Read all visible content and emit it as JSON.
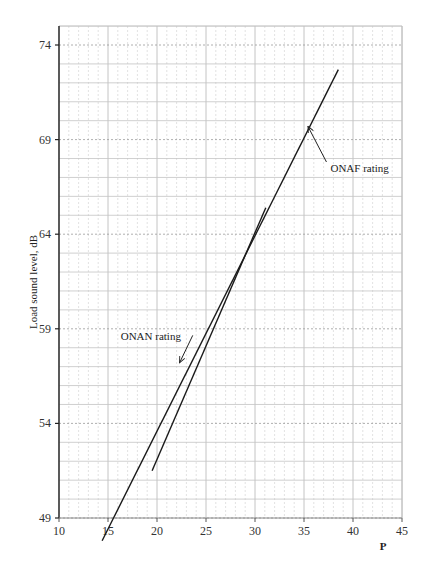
{
  "chart_data": {
    "type": "line",
    "title": "",
    "xlabel": "P",
    "ylabel": "Load sound level, dB",
    "xlim": [
      10,
      45
    ],
    "ylim": [
      49,
      74
    ],
    "x_ticks": [
      10,
      15,
      20,
      25,
      30,
      35,
      40,
      45
    ],
    "y_ticks": [
      49,
      54,
      59,
      64,
      69,
      74
    ],
    "grid": true,
    "legend": null,
    "series": [
      {
        "name": "ONAF rating",
        "x": [
          14.4,
          38.5
        ],
        "y": [
          47.8,
          72.7
        ]
      },
      {
        "name": "ONAN rating",
        "x": [
          19.5,
          31.1
        ],
        "y": [
          51.5,
          65.4
        ]
      }
    ],
    "annotations": [
      {
        "text": "ONAF rating",
        "x": 37.7,
        "y": 67.5,
        "arrow_to": [
          35.4,
          69.7
        ]
      },
      {
        "text": "ONAN rating",
        "x": 16.3,
        "y": 58.6,
        "arrow_to": [
          22.3,
          57.2
        ]
      }
    ]
  }
}
